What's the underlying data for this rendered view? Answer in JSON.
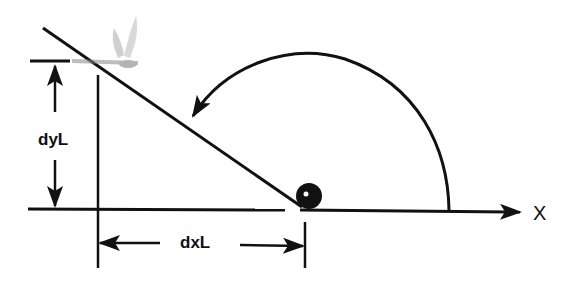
{
  "diagram": {
    "labels": {
      "vertical_distance": "dyL",
      "horizontal_distance": "dxL",
      "axis": "X"
    },
    "elements": [
      "inclined line (launch/flight path)",
      "dragonfly (target) at top of inclined line",
      "ball (origin) on X axis",
      "curved arrow indicating angle measured counter-clockwise from X axis"
    ],
    "colors": {
      "stroke": "#111111",
      "dragonfly": "#9a9a9a",
      "background": "#ffffff"
    }
  }
}
